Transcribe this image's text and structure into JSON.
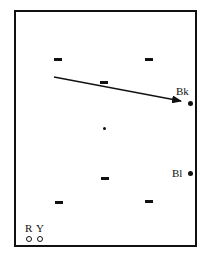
{
  "diagram": {
    "type": "field-layout",
    "frame": {
      "x": 14,
      "y": 10,
      "width": 184,
      "height": 238
    },
    "dashes": [
      {
        "id": "dash-1",
        "x": 54,
        "y": 58
      },
      {
        "id": "dash-2",
        "x": 145,
        "y": 58
      },
      {
        "id": "dash-3",
        "x": 100,
        "y": 81
      },
      {
        "id": "dash-4",
        "x": 101,
        "y": 177
      },
      {
        "id": "dash-5",
        "x": 55,
        "y": 201
      },
      {
        "id": "dash-6",
        "x": 145,
        "y": 200
      }
    ],
    "center_dot": {
      "x": 103,
      "y": 127
    },
    "arrow": {
      "x1": 54,
      "y1": 77,
      "x2": 181,
      "y2": 101
    },
    "markers": [
      {
        "id": "bk",
        "label": "Bk",
        "label_x": 176,
        "label_y": 86,
        "dot_x": 188,
        "dot_y": 101,
        "style": "filled"
      },
      {
        "id": "bl",
        "label": "Bl",
        "label_x": 172,
        "label_y": 168,
        "dot_x": 188,
        "dot_y": 171,
        "style": "filled"
      },
      {
        "id": "r",
        "label": "R",
        "label_x": 25,
        "label_y": 223,
        "dot_x": 26,
        "dot_y": 236,
        "style": "ring"
      },
      {
        "id": "y",
        "label": "Y",
        "label_x": 36,
        "label_y": 223,
        "dot_x": 37,
        "dot_y": 236,
        "style": "ring"
      }
    ]
  }
}
